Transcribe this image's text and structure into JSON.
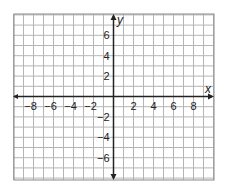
{
  "chart_data": {
    "type": "coordinate-grid",
    "title": "",
    "xlabel": "x",
    "ylabel": "y",
    "xlim": [
      -10,
      10
    ],
    "ylim": [
      -8,
      8
    ],
    "grid": true,
    "grid_step": 1,
    "x_tick_labels": [
      "-8",
      "-6",
      "-4",
      "-2",
      "2",
      "4",
      "6",
      "8"
    ],
    "x_tick_values": [
      -8,
      -6,
      -4,
      -2,
      2,
      4,
      6,
      8
    ],
    "y_tick_labels": [
      "6",
      "4",
      "2",
      "-2",
      "-4",
      "-6"
    ],
    "y_tick_values": [
      6,
      4,
      2,
      -2,
      -4,
      -6
    ],
    "series": []
  },
  "labels": {
    "x_axis": "x",
    "y_axis": "y"
  },
  "colors": {
    "grid": "#b5b5b5",
    "border": "#8a8a8a",
    "axis": "#222222"
  }
}
